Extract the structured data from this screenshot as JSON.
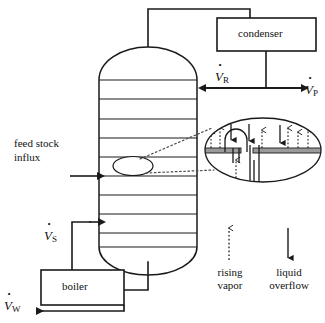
{
  "figure": {
    "type": "process-flow-diagram"
  },
  "equipment": {
    "condenser": {
      "label": "condenser"
    },
    "boiler": {
      "label": "boiler"
    },
    "column": {
      "label": ""
    }
  },
  "flows": {
    "reflux": {
      "symbol": "V",
      "subscript": "R",
      "dot": true
    },
    "product": {
      "symbol": "V",
      "subscript": "P",
      "dot": true
    },
    "steam": {
      "symbol": "V",
      "subscript": "S",
      "dot": true
    },
    "waste": {
      "symbol": "V",
      "subscript": "W",
      "dot": true
    }
  },
  "annotations": {
    "feed_line1": "feed stock",
    "feed_line2": "influx"
  },
  "legend": {
    "rising_vapor": {
      "line1": "rising",
      "line2": "vapor",
      "arrow": "dotted-up"
    },
    "liquid_overflow": {
      "line1": "liquid",
      "line2": "overflow",
      "arrow": "solid-down"
    }
  },
  "colors": {
    "stroke": "#1a1a1a",
    "tray_fill": "#9b9b9b",
    "background": "#ffffff"
  }
}
